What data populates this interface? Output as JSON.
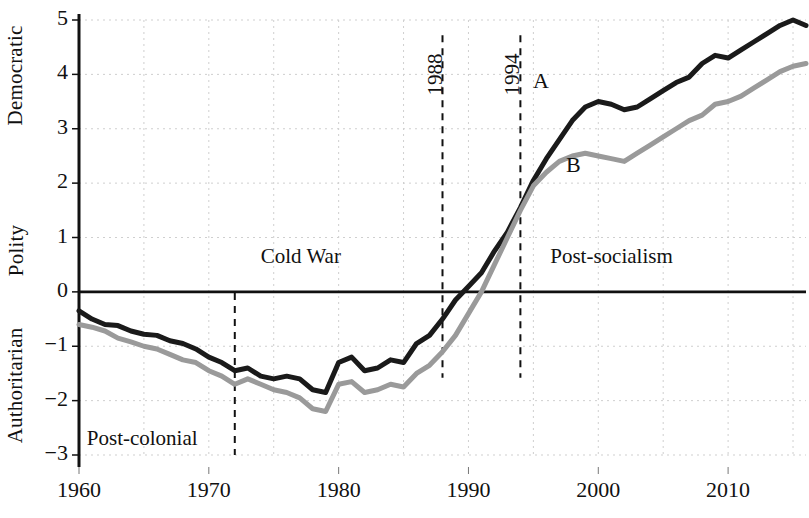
{
  "chart_data": {
    "type": "line",
    "title": "",
    "xlabel": "",
    "ylabel": "Polity",
    "ylabel_top": "Democratic",
    "ylabel_bottom": "Authoritarian",
    "xlim": [
      1960,
      2016
    ],
    "ylim": [
      -3,
      5
    ],
    "xticks": [
      1960,
      1970,
      1980,
      1990,
      2000,
      2010
    ],
    "xtick_labels": [
      "1960",
      "1970",
      "1980",
      "1990",
      "2000",
      "2010"
    ],
    "yticks": [
      -3,
      -2,
      -1,
      0,
      1,
      2,
      3,
      4,
      5
    ],
    "ytick_labels": [
      "−3",
      "−2",
      "−1",
      "0",
      "1",
      "2",
      "3",
      "4",
      "5"
    ],
    "grid": true,
    "grid_style": "dotted",
    "grid_x_step": 5,
    "zero_line": 0,
    "legend_position": "inline-annotation",
    "x": [
      1960,
      1961,
      1962,
      1963,
      1964,
      1965,
      1966,
      1967,
      1968,
      1969,
      1970,
      1971,
      1972,
      1973,
      1974,
      1975,
      1976,
      1977,
      1978,
      1979,
      1980,
      1981,
      1982,
      1983,
      1984,
      1985,
      1986,
      1987,
      1988,
      1989,
      1990,
      1991,
      1992,
      1993,
      1994,
      1995,
      1996,
      1997,
      1998,
      1999,
      2000,
      2001,
      2002,
      2003,
      2004,
      2005,
      2006,
      2007,
      2008,
      2009,
      2010,
      2011,
      2012,
      2013,
      2014,
      2015,
      2016
    ],
    "series": [
      {
        "name": "A",
        "color": "#1a1a1a",
        "label": "A",
        "values": [
          -0.35,
          -0.5,
          -0.6,
          -0.62,
          -0.72,
          -0.78,
          -0.8,
          -0.9,
          -0.95,
          -1.05,
          -1.2,
          -1.3,
          -1.45,
          -1.4,
          -1.55,
          -1.6,
          -1.55,
          -1.6,
          -1.8,
          -1.85,
          -1.3,
          -1.2,
          -1.45,
          -1.4,
          -1.25,
          -1.3,
          -0.95,
          -0.8,
          -0.5,
          -0.15,
          0.1,
          0.35,
          0.75,
          1.1,
          1.55,
          2.05,
          2.45,
          2.8,
          3.15,
          3.4,
          3.5,
          3.45,
          3.35,
          3.4,
          3.55,
          3.7,
          3.85,
          3.95,
          4.2,
          4.35,
          4.3,
          4.45,
          4.6,
          4.75,
          4.9,
          5.0,
          4.9
        ]
      },
      {
        "name": "B",
        "color": "#9a9a9a",
        "label": "B",
        "values": [
          -0.6,
          -0.65,
          -0.72,
          -0.85,
          -0.92,
          -1.0,
          -1.05,
          -1.15,
          -1.25,
          -1.3,
          -1.45,
          -1.55,
          -1.7,
          -1.6,
          -1.7,
          -1.8,
          -1.85,
          -1.95,
          -2.15,
          -2.2,
          -1.7,
          -1.65,
          -1.85,
          -1.8,
          -1.7,
          -1.75,
          -1.5,
          -1.35,
          -1.1,
          -0.8,
          -0.4,
          0.0,
          0.5,
          1.0,
          1.5,
          1.95,
          2.2,
          2.4,
          2.5,
          2.55,
          2.5,
          2.45,
          2.4,
          2.55,
          2.7,
          2.85,
          3.0,
          3.15,
          3.25,
          3.45,
          3.5,
          3.6,
          3.75,
          3.9,
          4.05,
          4.15,
          4.2
        ]
      }
    ],
    "era_annotations": [
      {
        "label": "Post-colonial",
        "x_text": 1960.6,
        "y_text": -2.72
      },
      {
        "label": "Cold War",
        "x_text": 1974.0,
        "y_text": 0.62
      },
      {
        "label": "Post-socialism",
        "x_text": 1996.3,
        "y_text": 0.62
      }
    ],
    "event_lines": [
      {
        "label": "",
        "year": 1972,
        "y_from": -3.0,
        "y_to": -0.02
      },
      {
        "label": "1988",
        "year": 1988,
        "y_from": -1.58,
        "y_to": 4.72
      },
      {
        "label": "1994",
        "year": 1994,
        "y_from": -1.58,
        "y_to": 4.72
      }
    ]
  }
}
